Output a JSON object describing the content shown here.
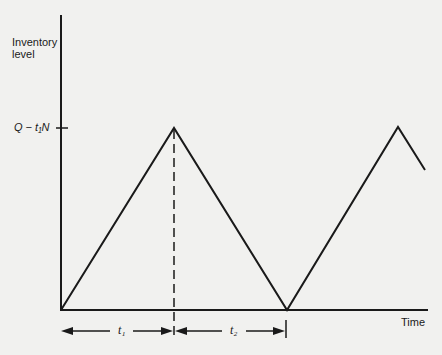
{
  "figure": {
    "y_axis_label_line1": "Inventory",
    "y_axis_label_line2": "level",
    "y_tick_label": "Q − t₁N",
    "x_axis_label": "Time",
    "interval_1_label": "t₁",
    "interval_2_label": "t₂"
  },
  "colors": {
    "background": "#f1f1ef",
    "line": "#1a1a1a"
  }
}
